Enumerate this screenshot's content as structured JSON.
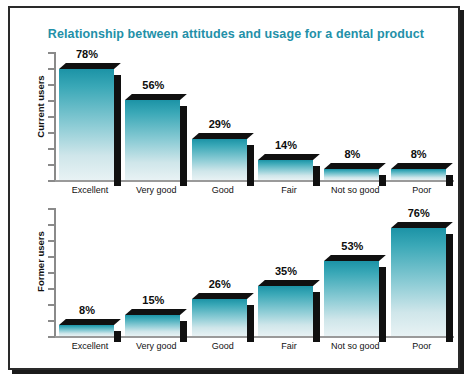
{
  "chart_data": {
    "type": "bar",
    "title": "Relationship between attitudes and usage for a dental product",
    "categories": [
      "Excellent",
      "Very good",
      "Good",
      "Fair",
      "Not so good",
      "Poor"
    ],
    "series": [
      {
        "name": "Current users",
        "values": [
          78,
          56,
          29,
          14,
          8,
          8
        ],
        "labels": [
          "78%",
          "56%",
          "29%",
          "14%",
          "8%",
          "8%"
        ]
      },
      {
        "name": "Former users",
        "values": [
          8,
          15,
          26,
          35,
          53,
          76
        ],
        "labels": [
          "8%",
          "15%",
          "26%",
          "35%",
          "53%",
          "76%"
        ]
      }
    ],
    "xlabel": "",
    "ylabel": "",
    "ylim": [
      0,
      90
    ],
    "yticks_count": 9,
    "ytick_labels": [],
    "grid": false,
    "legend": "none",
    "value_suffix": "%",
    "colors": {
      "title": "#2390a8",
      "bar_top": "#1c93a6",
      "bar_bottom": "#e8f2f4",
      "bar_3d": "#101010",
      "axis": "#8a8a8a",
      "frame": "#2a2a2a",
      "background": "#ffffff"
    }
  },
  "panels": [
    {
      "axis_title": "Current users"
    },
    {
      "axis_title": "Former users"
    }
  ]
}
